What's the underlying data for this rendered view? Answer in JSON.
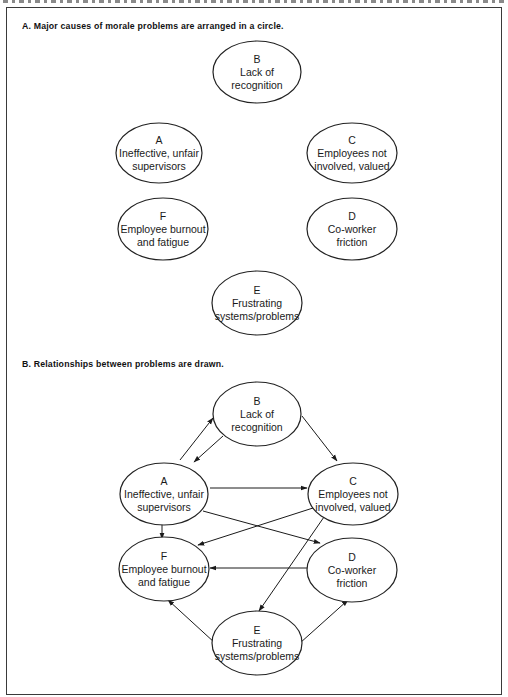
{
  "figure": {
    "section_a": {
      "heading": "A. Major causes of morale problems are arranged in a circle.",
      "nodes": [
        {
          "id": "B",
          "letter": "B",
          "line1": "Lack of",
          "line2": "recognition"
        },
        {
          "id": "A",
          "letter": "A",
          "line1": "Ineffective, unfair",
          "line2": "supervisors"
        },
        {
          "id": "C",
          "letter": "C",
          "line1": "Employees not",
          "line2": "involved, valued"
        },
        {
          "id": "F",
          "letter": "F",
          "line1": "Employee burnout",
          "line2": "and fatigue"
        },
        {
          "id": "D",
          "letter": "D",
          "line1": "Co-worker",
          "line2": "friction"
        },
        {
          "id": "E",
          "letter": "E",
          "line1": "Frustrating",
          "line2": "systems/problems"
        }
      ]
    },
    "section_b": {
      "heading": "B. Relationships between problems are drawn.",
      "nodes": [
        {
          "id": "B",
          "letter": "B",
          "line1": "Lack of",
          "line2": "recognition"
        },
        {
          "id": "A",
          "letter": "A",
          "line1": "Ineffective, unfair",
          "line2": "supervisors"
        },
        {
          "id": "C",
          "letter": "C",
          "line1": "Employees not",
          "line2": "involved, valued"
        },
        {
          "id": "F",
          "letter": "F",
          "line1": "Employee burnout",
          "line2": "and fatigue"
        },
        {
          "id": "D",
          "letter": "D",
          "line1": "Co-worker",
          "line2": "friction"
        },
        {
          "id": "E",
          "letter": "E",
          "line1": "Frustrating",
          "line2": "systems/problems"
        }
      ],
      "edges": [
        {
          "from": "A",
          "to": "B"
        },
        {
          "from": "B",
          "to": "A"
        },
        {
          "from": "B",
          "to": "C"
        },
        {
          "from": "A",
          "to": "C"
        },
        {
          "from": "A",
          "to": "F"
        },
        {
          "from": "A",
          "to": "D"
        },
        {
          "from": "C",
          "to": "F"
        },
        {
          "from": "C",
          "to": "E"
        },
        {
          "from": "D",
          "to": "F"
        },
        {
          "from": "E",
          "to": "F"
        },
        {
          "from": "E",
          "to": "D"
        }
      ]
    }
  }
}
